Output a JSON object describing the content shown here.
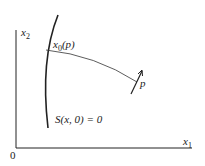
{
  "figure": {
    "axes": {
      "x_label": "x",
      "x_sub": "1",
      "y_label": "x",
      "y_sub": "2",
      "origin": "0"
    },
    "labels": {
      "start_point": {
        "base": "x",
        "sub": "0",
        "arg": "(p)"
      },
      "end_point": "p",
      "surface": {
        "text_a": "S(x",
        "text_b": ", 0) = 0"
      }
    },
    "colors": {
      "stroke": "#222222",
      "background": "#ffffff"
    }
  }
}
